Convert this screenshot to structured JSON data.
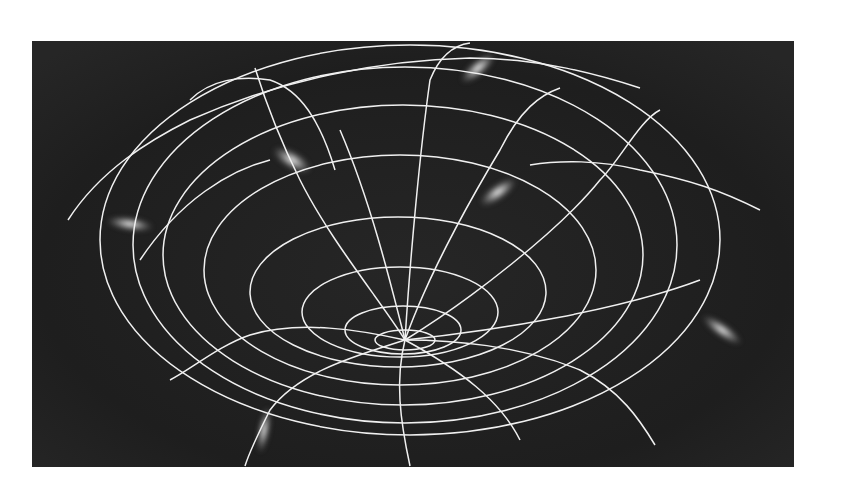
{
  "figure": {
    "background_color": "#1c1c1c",
    "grid_color": "#f2f2f2",
    "glow_color": "#ffffff",
    "funnel_center": {
      "x": 405,
      "y": 345
    },
    "ring_count": 8,
    "glow_count": 7
  }
}
